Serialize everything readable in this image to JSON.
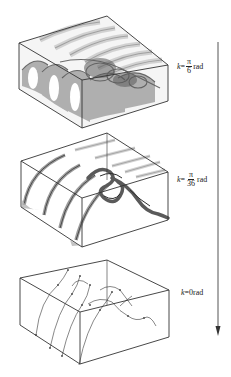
{
  "figure": {
    "panels": [
      {
        "id": "panel-1",
        "label": {
          "var": "k",
          "eq": "=",
          "num": "π",
          "den": "6",
          "unit": "rad"
        },
        "description": "dense translucent surface with many helical sheets"
      },
      {
        "id": "panel-2",
        "label": {
          "var": "k",
          "eq": "=",
          "num": "π",
          "den": "36",
          "unit": "rad"
        },
        "description": "arched sheets and helical tube"
      },
      {
        "id": "panel-3",
        "label": {
          "var": "k",
          "eq": "=",
          "value": "0",
          "unit": "rad"
        },
        "description": "thin curves (streamlines) with dots"
      }
    ],
    "arrow": {
      "direction": "down"
    },
    "colors": {
      "line": "#333333",
      "surface_dark": "#555555",
      "surface_light": "#cccccc"
    }
  }
}
